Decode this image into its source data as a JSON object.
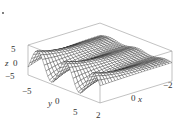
{
  "chart_data": {
    "type": "surface3d",
    "title": "",
    "xlabel": "x",
    "ylabel": "y",
    "zlabel": "z",
    "xlim": [
      -2,
      2
    ],
    "ylim": [
      -7,
      7
    ],
    "zlim": [
      -7,
      7
    ],
    "x_ticks": [
      "2",
      "0",
      "−2"
    ],
    "y_ticks": [
      "−5",
      "0",
      "5"
    ],
    "z_ticks": [
      "5",
      "0",
      "−5"
    ],
    "grid": false,
    "box": true,
    "mesh": {
      "nx": 40,
      "ny": 24
    },
    "surface_description": "Wireframe surface that oscillates along y with sharp ridges/troughs at x≈2 (front) decaying toward a flat plateau as x→−2 (back)",
    "corner_mark": "."
  },
  "colors": {
    "mesh": "#222222",
    "box": "#888888",
    "text": "#333333"
  }
}
